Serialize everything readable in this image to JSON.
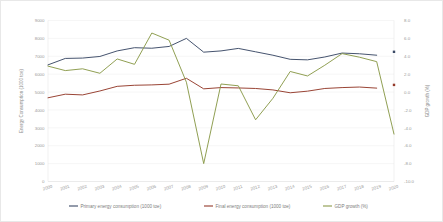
{
  "chart_data": {
    "type": "line",
    "title": "",
    "xlabel": "",
    "ylabel": "Energy Consumption (1000 toe)",
    "y2label": "GDP growth (%)",
    "grid": true,
    "legend_position": "bottom",
    "x": [
      2000,
      2001,
      2002,
      2003,
      2004,
      2005,
      2006,
      2007,
      2008,
      2009,
      2010,
      2011,
      2012,
      2013,
      2014,
      2015,
      2016,
      2017,
      2018,
      2019,
      2020
    ],
    "x_tick_labels": [
      "2000",
      "2001",
      "2002",
      "2003",
      "2004",
      "2005",
      "2006",
      "2007",
      "2008",
      "2009",
      "2010",
      "2011",
      "2012",
      "2013",
      "2014",
      "2015",
      "2016",
      "2017",
      "2018",
      "2019",
      "2020"
    ],
    "ylim": [
      0,
      9000
    ],
    "y_tick_labels": [
      "0",
      "1000",
      "2000",
      "3000",
      "4000",
      "5000",
      "6000",
      "7000",
      "8000",
      "9000"
    ],
    "y_ticks": [
      0,
      1000,
      2000,
      3000,
      4000,
      5000,
      6000,
      7000,
      8000,
      9000
    ],
    "y2lim": [
      -10.0,
      8.0
    ],
    "y2_tick_labels": [
      "-10.0",
      "-8.0",
      "-6.0",
      "-4.0",
      "-2.0",
      "0.0",
      "2.0",
      "4.0",
      "6.0",
      "8.0"
    ],
    "y2_ticks": [
      -10.0,
      -8.0,
      -6.0,
      -4.0,
      -2.0,
      0.0,
      2.0,
      4.0,
      6.0,
      8.0
    ],
    "series": [
      {
        "name": "Primary energy consumption (1000 toe)",
        "axis": "left",
        "color": "#3b4a66",
        "values": [
          6520,
          6880,
          6900,
          6990,
          7300,
          7480,
          7450,
          7550,
          8000,
          7230,
          7300,
          7440,
          7250,
          7060,
          6830,
          6800,
          6960,
          7180,
          7140,
          7060,
          7250
        ],
        "gap_before_last": true,
        "last_point_marker": true
      },
      {
        "name": "Final energy consumption (1000 toe)",
        "axis": "left",
        "color": "#943a2a",
        "values": [
          4680,
          4880,
          4840,
          5060,
          5320,
          5380,
          5400,
          5440,
          5770,
          5180,
          5250,
          5230,
          5200,
          5120,
          4960,
          5050,
          5200,
          5250,
          5280,
          5220,
          5400
        ],
        "gap_before_last": true,
        "last_point_marker": true
      },
      {
        "name": "GDP growth (%)",
        "axis": "right",
        "color": "#8a9a4a",
        "values": [
          2.9,
          2.4,
          2.6,
          2.1,
          3.7,
          3.1,
          6.6,
          5.8,
          1.1,
          -8.0,
          0.9,
          0.7,
          -3.1,
          -0.7,
          2.3,
          1.8,
          3.0,
          4.3,
          3.9,
          3.4,
          -4.7
        ]
      }
    ]
  }
}
